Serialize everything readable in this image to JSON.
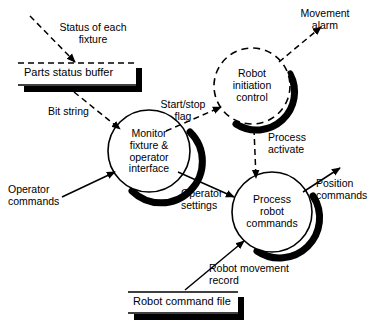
{
  "diagram": {
    "type": "data-flow-diagram",
    "colors": {
      "stroke": "#000000",
      "fill": "#ffffff",
      "shadow": "#000000",
      "background": "#ffffff"
    },
    "processes": [
      {
        "id": "monitor-fixture-operator-interface",
        "label": "Monitor\nfixture &\noperator\ninterface",
        "style": "solid",
        "shadow": true,
        "cx": 149,
        "cy": 151,
        "r": 41
      },
      {
        "id": "robot-initiation-control",
        "label": "Robot\ninitiation\ncontrol",
        "style": "dashed",
        "shadow": true,
        "cx": 252,
        "cy": 86,
        "r": 38
      },
      {
        "id": "process-robot-commands",
        "label": "Process\nrobot\ncommands",
        "style": "solid",
        "shadow": true,
        "cx": 272,
        "cy": 212,
        "r": 40
      }
    ],
    "stores": [
      {
        "id": "parts-status-buffer",
        "label": "Parts status buffer",
        "top_line": "dashed",
        "x": 18,
        "y": 63,
        "width": 118,
        "height": 22
      },
      {
        "id": "robot-command-file",
        "label": "Robot command file",
        "top_line": "solid",
        "x": 128,
        "y": 292,
        "width": 110,
        "height": 21
      }
    ],
    "flows": [
      {
        "id": "status-of-each-fixture",
        "label": "Status of each\nfixture",
        "style": "dashed",
        "direction": "into-store"
      },
      {
        "id": "bit-string",
        "label": "Bit string",
        "style": "dashed",
        "direction": "store-to-process"
      },
      {
        "id": "start-stop-flag",
        "label": "Start/stop\nflag",
        "style": "dashed",
        "direction": "process-to-process"
      },
      {
        "id": "movement-alarm",
        "label": "Movement\nalarm",
        "style": "dashed",
        "direction": "out-of-diagram"
      },
      {
        "id": "process-activate",
        "label": "Process\nactivate",
        "style": "dashed",
        "direction": "process-to-process"
      },
      {
        "id": "operator-commands",
        "label": "Operator\ncommands",
        "style": "solid",
        "direction": "into-process"
      },
      {
        "id": "operator-settings",
        "label": "Operator\nsettings",
        "style": "solid",
        "direction": "process-to-process"
      },
      {
        "id": "position-commands",
        "label": "Position\ncommands",
        "style": "solid",
        "direction": "out-of-diagram"
      },
      {
        "id": "robot-movement-record",
        "label": "Robot movement\nrecord",
        "style": "solid",
        "direction": "store-to-process"
      }
    ]
  }
}
